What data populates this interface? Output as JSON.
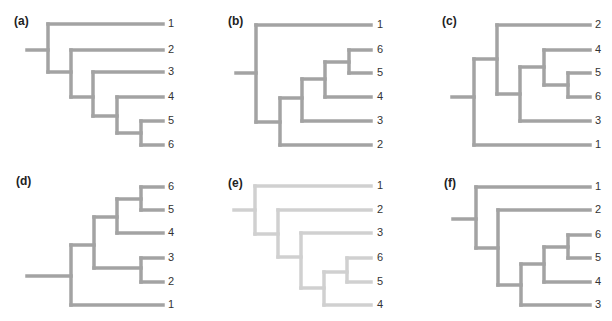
{
  "figure": {
    "title": "",
    "branch_color": "#a3a3a3",
    "branch_color_light": "#d0d0d0",
    "branch_width": 3.5,
    "panels": [
      {
        "id": "a",
        "label": "(a)",
        "label_pos": [
          14,
          23
        ],
        "light": false,
        "newick": "(1,(2,(3,(4,(5,6)))))",
        "segments": [
          [
            27,
            50,
            48,
            50
          ],
          [
            48,
            24,
            48,
            72
          ],
          [
            48,
            24,
            163,
            24
          ],
          [
            48,
            72,
            71,
            72
          ],
          [
            71,
            50,
            71,
            97
          ],
          [
            71,
            50,
            163,
            50
          ],
          [
            71,
            97,
            93,
            97
          ],
          [
            93,
            72,
            93,
            116
          ],
          [
            93,
            72,
            163,
            72
          ],
          [
            93,
            116,
            117,
            116
          ],
          [
            117,
            97,
            117,
            133
          ],
          [
            117,
            97,
            163,
            97
          ],
          [
            117,
            133,
            141,
            133
          ],
          [
            141,
            121,
            141,
            145
          ],
          [
            141,
            121,
            163,
            121
          ],
          [
            141,
            145,
            163,
            145
          ]
        ],
        "leaves": [
          {
            "text": "1",
            "x": 168,
            "y": 24
          },
          {
            "text": "2",
            "x": 168,
            "y": 50
          },
          {
            "text": "3",
            "x": 168,
            "y": 72
          },
          {
            "text": "4",
            "x": 168,
            "y": 97
          },
          {
            "text": "5",
            "x": 168,
            "y": 121
          },
          {
            "text": "6",
            "x": 168,
            "y": 145
          }
        ]
      },
      {
        "id": "b",
        "label": "(b)",
        "label_pos": [
          228,
          23
        ],
        "light": false,
        "newick": "(1,(2,(3,(4,(5,6)))))",
        "segments": [
          [
            236,
            73,
            256,
            73
          ],
          [
            256,
            25,
            256,
            122
          ],
          [
            256,
            25,
            371,
            25
          ],
          [
            256,
            122,
            280,
            122
          ],
          [
            280,
            98,
            280,
            145
          ],
          [
            280,
            145,
            371,
            145
          ],
          [
            280,
            98,
            302,
            98
          ],
          [
            302,
            79,
            302,
            121
          ],
          [
            302,
            121,
            371,
            121
          ],
          [
            302,
            79,
            325,
            79
          ],
          [
            325,
            62,
            325,
            97
          ],
          [
            325,
            97,
            371,
            97
          ],
          [
            325,
            62,
            349,
            62
          ],
          [
            349,
            50,
            349,
            73
          ],
          [
            349,
            50,
            371,
            50
          ],
          [
            349,
            73,
            371,
            73
          ]
        ],
        "leaves": [
          {
            "text": "1",
            "x": 377,
            "y": 25
          },
          {
            "text": "6",
            "x": 377,
            "y": 50
          },
          {
            "text": "5",
            "x": 377,
            "y": 73
          },
          {
            "text": "4",
            "x": 377,
            "y": 97
          },
          {
            "text": "3",
            "x": 377,
            "y": 121
          },
          {
            "text": "2",
            "x": 377,
            "y": 145
          }
        ]
      },
      {
        "id": "c",
        "label": "(c)",
        "label_pos": [
          442,
          23
        ],
        "light": false,
        "newick": "(1,(2,(3,(4,(5,6)))))",
        "segments": [
          [
            452,
            97,
            474,
            97
          ],
          [
            474,
            59,
            474,
            145
          ],
          [
            474,
            145,
            590,
            145
          ],
          [
            474,
            59,
            497,
            59
          ],
          [
            497,
            25,
            497,
            94
          ],
          [
            497,
            25,
            590,
            25
          ],
          [
            497,
            94,
            520,
            94
          ],
          [
            520,
            67,
            520,
            121
          ],
          [
            520,
            121,
            590,
            121
          ],
          [
            520,
            67,
            544,
            67
          ],
          [
            544,
            50,
            544,
            85
          ],
          [
            544,
            50,
            590,
            50
          ],
          [
            544,
            85,
            568,
            85
          ],
          [
            568,
            73,
            568,
            97
          ],
          [
            568,
            73,
            590,
            73
          ],
          [
            568,
            97,
            590,
            97
          ]
        ],
        "leaves": [
          {
            "text": "2",
            "x": 595,
            "y": 25
          },
          {
            "text": "4",
            "x": 595,
            "y": 50
          },
          {
            "text": "5",
            "x": 595,
            "y": 73
          },
          {
            "text": "6",
            "x": 595,
            "y": 97
          },
          {
            "text": "3",
            "x": 595,
            "y": 121
          },
          {
            "text": "1",
            "x": 595,
            "y": 145
          }
        ]
      },
      {
        "id": "d",
        "label": "(d)",
        "label_pos": [
          16,
          183
        ],
        "light": false,
        "newick": "(1,((2,3),(4,(5,6))))",
        "segments": [
          [
            27,
            276,
            71,
            276
          ],
          [
            71,
            245,
            71,
            305
          ],
          [
            71,
            305,
            163,
            305
          ],
          [
            71,
            245,
            94,
            245
          ],
          [
            94,
            217,
            94,
            268
          ],
          [
            94,
            217,
            117,
            217
          ],
          [
            94,
            268,
            141,
            268
          ],
          [
            117,
            199,
            117,
            233
          ],
          [
            117,
            233,
            163,
            233
          ],
          [
            117,
            199,
            141,
            199
          ],
          [
            141,
            187,
            141,
            210
          ],
          [
            141,
            187,
            163,
            187
          ],
          [
            141,
            210,
            163,
            210
          ],
          [
            141,
            258,
            141,
            282
          ],
          [
            141,
            258,
            163,
            258
          ],
          [
            141,
            282,
            163,
            282
          ]
        ],
        "leaves": [
          {
            "text": "6",
            "x": 168,
            "y": 187
          },
          {
            "text": "5",
            "x": 168,
            "y": 210
          },
          {
            "text": "4",
            "x": 168,
            "y": 233
          },
          {
            "text": "3",
            "x": 168,
            "y": 258
          },
          {
            "text": "2",
            "x": 168,
            "y": 282
          },
          {
            "text": "1",
            "x": 168,
            "y": 305
          }
        ]
      },
      {
        "id": "e",
        "label": "(e)",
        "label_pos": [
          228,
          185
        ],
        "light": true,
        "newick": "(1,(2,(3,(4,(5,6)))))",
        "segments": [
          [
            234,
            210,
            255,
            210
          ],
          [
            255,
            186,
            255,
            234
          ],
          [
            255,
            186,
            371,
            186
          ],
          [
            255,
            234,
            278,
            234
          ],
          [
            278,
            210,
            278,
            257
          ],
          [
            278,
            210,
            371,
            210
          ],
          [
            278,
            257,
            301,
            257
          ],
          [
            301,
            233,
            301,
            288
          ],
          [
            301,
            233,
            371,
            233
          ],
          [
            301,
            288,
            324,
            288
          ],
          [
            324,
            272,
            324,
            305
          ],
          [
            324,
            305,
            371,
            305
          ],
          [
            324,
            272,
            347,
            272
          ],
          [
            347,
            258,
            347,
            282
          ],
          [
            347,
            258,
            371,
            258
          ],
          [
            347,
            282,
            371,
            282
          ]
        ],
        "leaves": [
          {
            "text": "1",
            "x": 377,
            "y": 186
          },
          {
            "text": "2",
            "x": 377,
            "y": 210
          },
          {
            "text": "3",
            "x": 377,
            "y": 233
          },
          {
            "text": "6",
            "x": 377,
            "y": 258
          },
          {
            "text": "5",
            "x": 377,
            "y": 282
          },
          {
            "text": "4",
            "x": 377,
            "y": 305
          }
        ]
      },
      {
        "id": "f",
        "label": "(f)",
        "label_pos": [
          444,
          185
        ],
        "light": false,
        "newick": "(1,(2,(3,(4,(5,6)))))",
        "segments": [
          [
            453,
            219,
            476,
            219
          ],
          [
            476,
            187,
            476,
            248
          ],
          [
            476,
            187,
            590,
            187
          ],
          [
            476,
            248,
            498,
            248
          ],
          [
            498,
            210,
            498,
            285
          ],
          [
            498,
            210,
            590,
            210
          ],
          [
            498,
            285,
            521,
            285
          ],
          [
            521,
            264,
            521,
            305
          ],
          [
            521,
            305,
            590,
            305
          ],
          [
            521,
            264,
            544,
            264
          ],
          [
            544,
            247,
            544,
            282
          ],
          [
            544,
            282,
            590,
            282
          ],
          [
            544,
            247,
            568,
            247
          ],
          [
            568,
            235,
            568,
            258
          ],
          [
            568,
            235,
            590,
            235
          ],
          [
            568,
            258,
            590,
            258
          ]
        ],
        "leaves": [
          {
            "text": "1",
            "x": 595,
            "y": 187
          },
          {
            "text": "2",
            "x": 595,
            "y": 210
          },
          {
            "text": "6",
            "x": 595,
            "y": 235
          },
          {
            "text": "5",
            "x": 595,
            "y": 258
          },
          {
            "text": "4",
            "x": 595,
            "y": 282
          },
          {
            "text": "3",
            "x": 595,
            "y": 305
          }
        ]
      }
    ]
  }
}
